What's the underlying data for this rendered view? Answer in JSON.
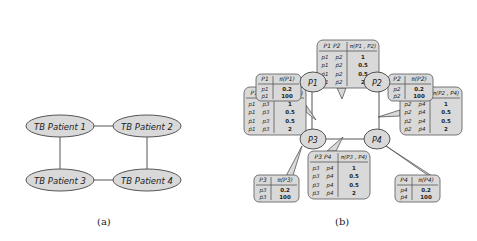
{
  "panel_a": {
    "caption": "(a)",
    "nodes": [
      {
        "id": "n1",
        "label": "TB Patient 1"
      },
      {
        "id": "n2",
        "label": "TB Patient 2"
      },
      {
        "id": "n3",
        "label": "TB Patient 3"
      },
      {
        "id": "n4",
        "label": "TB Patient 4"
      }
    ],
    "edges": [
      [
        "n1",
        "n2"
      ],
      [
        "n1",
        "n3"
      ],
      [
        "n2",
        "n4"
      ],
      [
        "n3",
        "n4"
      ]
    ]
  },
  "panel_b": {
    "caption": "(b)",
    "nodes": [
      {
        "id": "P1",
        "label": "P1"
      },
      {
        "id": "P2",
        "label": "P2"
      },
      {
        "id": "P3",
        "label": "P3"
      },
      {
        "id": "P4",
        "label": "P4"
      }
    ],
    "unary_tables": {
      "P1": {
        "header": [
          "P1",
          "π(P1)"
        ],
        "rows": [
          [
            "p1",
            "0.2"
          ],
          [
            "p̄1",
            "100"
          ]
        ]
      },
      "P2": {
        "header": [
          "P2",
          "π(P2)"
        ],
        "rows": [
          [
            "p2",
            "0.2"
          ],
          [
            "p̄2",
            "100"
          ]
        ]
      },
      "P3": {
        "header": [
          "P3",
          "π(P3)"
        ],
        "rows": [
          [
            "p3",
            "0.2"
          ],
          [
            "p̄3",
            "100"
          ]
        ]
      },
      "P4": {
        "header": [
          "P4",
          "π(P4)"
        ],
        "rows": [
          [
            "p4",
            "0.2"
          ],
          [
            "p̄4",
            "100"
          ]
        ]
      }
    },
    "pair_tables": {
      "P1P2": {
        "header": [
          "P1  P2",
          "π(P1 , P2)"
        ],
        "rows": [
          [
            "p1",
            "p2",
            "1"
          ],
          [
            "p1",
            "p̄2",
            "0.5"
          ],
          [
            "p̄1",
            "p2",
            "0.5"
          ],
          [
            "p̄1",
            "p̄2",
            "2"
          ]
        ]
      },
      "P1P3": {
        "header": [
          "P1  P3",
          "π(P1 , P3)"
        ],
        "rows": [
          [
            "p1",
            "p3",
            "1"
          ],
          [
            "p1",
            "p̄3",
            "0.5"
          ],
          [
            "p̄1",
            "p3",
            "0.5"
          ],
          [
            "p̄1",
            "p̄3",
            "2"
          ]
        ]
      },
      "P2P4": {
        "header": [
          "P2  P4",
          "π(P2 , P4)"
        ],
        "rows": [
          [
            "p2",
            "p4",
            "1"
          ],
          [
            "p2",
            "p̄4",
            "0.5"
          ],
          [
            "p̄2",
            "p4",
            "0.5"
          ],
          [
            "p̄2",
            "p̄4",
            "2"
          ]
        ]
      },
      "P3P4": {
        "header": [
          "P3  P4",
          "π(P3 , P4)"
        ],
        "rows": [
          [
            "p3",
            "p4",
            "1"
          ],
          [
            "p3",
            "p̄4",
            "0.5"
          ],
          [
            "p̄3",
            "p4",
            "0.5"
          ],
          [
            "p̄3",
            "p̄4",
            "2"
          ]
        ]
      }
    }
  },
  "colors": {
    "fill": "#d9d9d9",
    "stroke": "#555555",
    "text": "#222222"
  }
}
